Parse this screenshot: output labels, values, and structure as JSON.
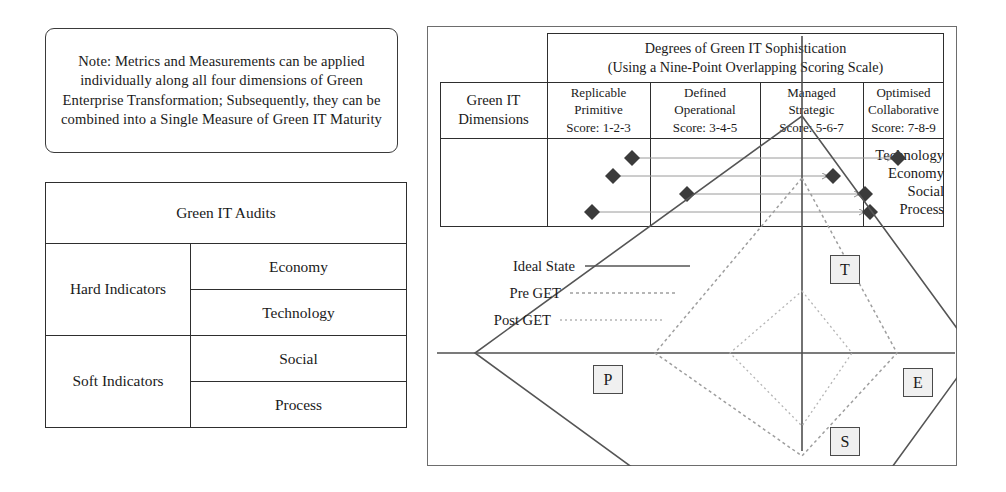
{
  "note": {
    "text": "Note: Metrics and Measurements can be applied individually along all four dimensions of Green Enterprise Transformation; Subsequently, they can be combined into a Single Measure of Green IT Maturity"
  },
  "audits": {
    "title": "Green IT Audits",
    "groups": [
      {
        "label": "Hard Indicators",
        "items": [
          "Economy",
          "Technology"
        ]
      },
      {
        "label": "Soft Indicators",
        "items": [
          "Social",
          "Process"
        ]
      }
    ]
  },
  "maturity": {
    "degrees_title": "Degrees of Green IT Sophistication (Using a Nine-Point Overlapping Scoring Scale)",
    "degrees_title_line1": "Degrees of Green IT Sophistication",
    "degrees_title_line2": "(Using a Nine-Point Overlapping Scoring Scale)",
    "dimensions_title": "Green IT Dimensions",
    "dimensions_title_line1": "Green IT",
    "dimensions_title_line2": "Dimensions",
    "stages": [
      {
        "name_line1": "Replicable",
        "name_line2": "Primitive",
        "score": "Score: 1-2-3"
      },
      {
        "name_line1": "Defined",
        "name_line2": "Operational",
        "score": "Score: 3-4-5"
      },
      {
        "name_line1": "Managed",
        "name_line2": "Strategic",
        "score": "Score: 5-6-7"
      },
      {
        "name_line1": "Optimised",
        "name_line2": "Collaborative",
        "score": "Score: 7-8-9"
      }
    ],
    "rows": [
      {
        "label": "Technology",
        "from_x": 192,
        "to_x": 458,
        "y": 125
      },
      {
        "label": "Economy",
        "from_x": 173,
        "to_x": 393,
        "y": 143
      },
      {
        "label": "Social",
        "from_x": 247,
        "to_x": 425,
        "y": 161
      },
      {
        "label": "Process",
        "from_x": 152,
        "to_x": 430,
        "y": 179
      }
    ]
  },
  "chart_data": {
    "type": "radar",
    "axes": [
      "T",
      "E",
      "S",
      "P"
    ],
    "axis_labels": {
      "T": "Technology",
      "E": "Economy",
      "S": "Social",
      "P": "Process"
    },
    "legend": [
      {
        "label": "Ideal State",
        "style": "solid"
      },
      {
        "label": "Pre GET",
        "style": "dotted"
      },
      {
        "label": "Post GET",
        "style": "dotted-fine"
      }
    ],
    "series": [
      {
        "name": "Ideal State",
        "style": "solid",
        "values": {
          "T": 1.0,
          "E": 1.0,
          "S": 1.0,
          "P": 1.0
        },
        "points_px": [
          [
            375,
            90
          ],
          [
            548,
            327
          ],
          [
            375,
            565
          ],
          [
            48,
            327
          ]
        ]
      },
      {
        "name": "Pre GET",
        "style": "dotted",
        "values": {
          "T": 0.45,
          "E": 0.45,
          "S": 0.45,
          "P": 0.45
        },
        "points_px": [
          [
            375,
            152
          ],
          [
            470,
            327
          ],
          [
            375,
            430
          ],
          [
            228,
            327
          ]
        ]
      },
      {
        "name": "Post GET",
        "style": "dotted-fine",
        "values": {
          "T": 0.25,
          "E": 0.25,
          "S": 0.25,
          "P": 0.25
        },
        "points_px": [
          [
            375,
            265
          ],
          [
            425,
            327
          ],
          [
            375,
            400
          ],
          [
            303,
            327
          ]
        ]
      }
    ],
    "center_px": [
      375,
      327
    ],
    "grid": false,
    "legend_position": "left"
  },
  "radar_boxes": [
    {
      "label": "T",
      "left": 403,
      "top": 229
    },
    {
      "label": "E",
      "left": 476,
      "top": 342
    },
    {
      "label": "S",
      "left": 403,
      "top": 401
    },
    {
      "label": "P",
      "left": 166,
      "top": 339
    }
  ]
}
